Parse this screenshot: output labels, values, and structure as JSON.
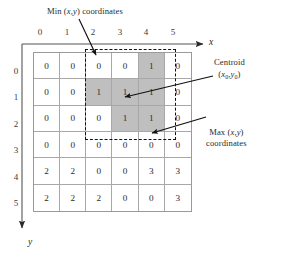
{
  "figure": {
    "type": "grid-diagram"
  },
  "axes": {
    "x_label": "x",
    "y_label": "y",
    "x_ticks": [
      "0",
      "1",
      "2",
      "3",
      "4",
      "5"
    ],
    "y_ticks": [
      "0",
      "1",
      "2",
      "3",
      "4",
      "5"
    ]
  },
  "grid": {
    "rows": 6,
    "cols": 6,
    "values": [
      [
        "0",
        "0",
        "0",
        "0",
        "1",
        "0"
      ],
      [
        "0",
        "0",
        "1",
        "1",
        "1",
        "0"
      ],
      [
        "0",
        "0",
        "0",
        "1",
        "1",
        "0"
      ],
      [
        "0",
        "0",
        "0",
        "0",
        "0",
        "0"
      ],
      [
        "2",
        "2",
        "0",
        "0",
        "3",
        "3"
      ],
      [
        "2",
        "2",
        "2",
        "0",
        "0",
        "3"
      ]
    ],
    "shaded": [
      [
        false,
        false,
        false,
        false,
        true,
        false
      ],
      [
        false,
        false,
        true,
        true,
        true,
        false
      ],
      [
        false,
        false,
        false,
        true,
        true,
        false
      ],
      [
        false,
        false,
        false,
        false,
        false,
        false
      ],
      [
        false,
        false,
        false,
        false,
        false,
        false
      ],
      [
        false,
        false,
        false,
        false,
        false,
        false
      ]
    ],
    "shade_color": "#bfbfbf",
    "line_color": "#a8a8a8"
  },
  "bounding_box": {
    "style": "dashed",
    "color": "#111111",
    "min_cell": [
      2,
      0
    ],
    "max_cell": [
      4,
      2
    ]
  },
  "annotations": {
    "min_label": {
      "prefix": "Min (",
      "vars": "x,y",
      "suffix": ") coordinates"
    },
    "centroid_label": {
      "title": "Centroid",
      "open": "(",
      "x_var": "x",
      "x_sub": "0",
      "comma": ",",
      "y_var": "y",
      "y_sub": "0",
      "close": ")"
    },
    "max_label": {
      "line1_prefix": "Max (",
      "line1_vars": "x,y",
      "line1_suffix": ")",
      "line2": "coordinates"
    }
  }
}
